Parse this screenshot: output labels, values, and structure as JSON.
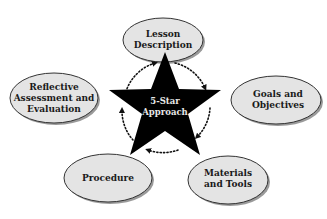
{
  "diagram": {
    "center": {
      "line1": "5-Star",
      "line2": "Approach",
      "shape": "star",
      "fill": "#000000"
    },
    "cycle": {
      "style": "dotted-circle-with-arrows",
      "direction": "clockwise"
    },
    "nodes": [
      {
        "id": "lesson-description",
        "line1": "Lesson",
        "line2": "Description"
      },
      {
        "id": "goals-objectives",
        "line1": "Goals and",
        "line2": "Objectives"
      },
      {
        "id": "materials-tools",
        "line1": "Materials",
        "line2": "and Tools"
      },
      {
        "id": "procedure",
        "line1": "Procedure"
      },
      {
        "id": "reflective-assessment",
        "line1": "Reflective",
        "line2": "Assessment and",
        "line3": "Evaluation"
      }
    ],
    "colors": {
      "ellipse_fill": "#e4e4e4",
      "ellipse_stroke": "#333333",
      "shadow": "#9a9a9a",
      "star": "#000000",
      "dots": "#111111"
    }
  }
}
